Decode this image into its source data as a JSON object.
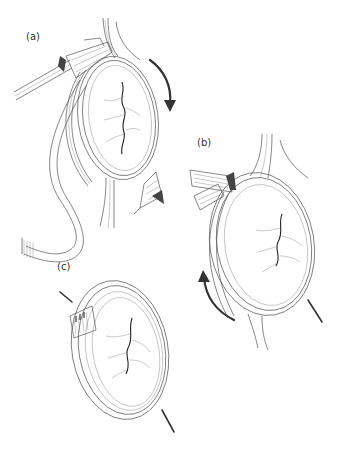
{
  "figure": {
    "panels": [
      {
        "label": "(a)",
        "description": "Valve annulus with band being wrapped; instrument at top left holding band, suture needle at lower right, clockwise arrow on right side"
      },
      {
        "label": "(b)",
        "description": "Band passed around valve annulus with ends overlapping at top left; curved arrow on lower left side, needle at lower right"
      },
      {
        "label": "(c)",
        "description": "Completed ring around annulus, band ends joined with stitches at upper left; needle at lower right"
      }
    ],
    "colors": {
      "line": "#555555",
      "arrow": "#333333",
      "background": "#ffffff"
    }
  }
}
